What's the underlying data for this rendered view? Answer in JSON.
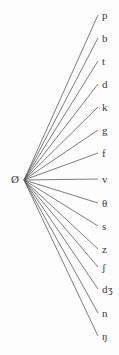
{
  "diagram": {
    "type": "fan-tree",
    "title": "",
    "background_color": "#fdfdfd",
    "edge_color": "#5a5a5a",
    "text_color": "#3a3a3a",
    "root": {
      "label": "Ø",
      "name": "empty-set",
      "x": 15,
      "y": 179
    },
    "edge_start": {
      "x": 24,
      "y": 180
    },
    "edge_end_x": 98,
    "leaf_label_x": 102,
    "leaves": [
      {
        "label": "p",
        "name": "leaf-p",
        "y": 15
      },
      {
        "label": "b",
        "name": "leaf-b",
        "y": 38
      },
      {
        "label": "t",
        "name": "leaf-t",
        "y": 61
      },
      {
        "label": "d",
        "name": "leaf-d",
        "y": 84
      },
      {
        "label": "k",
        "name": "leaf-k",
        "y": 107
      },
      {
        "label": "g",
        "name": "leaf-g",
        "y": 130
      },
      {
        "label": "f",
        "name": "leaf-f",
        "y": 153
      },
      {
        "label": "v",
        "name": "leaf-v",
        "y": 179
      },
      {
        "label": "θ",
        "name": "leaf-theta",
        "y": 203
      },
      {
        "label": "s",
        "name": "leaf-s",
        "y": 226
      },
      {
        "label": "z",
        "name": "leaf-z",
        "y": 249
      },
      {
        "label": "ʃ",
        "name": "leaf-esh",
        "y": 267
      },
      {
        "label": "dʒ",
        "name": "leaf-dezh",
        "y": 289
      },
      {
        "label": "n",
        "name": "leaf-n",
        "y": 313
      },
      {
        "label": "ŋ",
        "name": "leaf-eng",
        "y": 336
      }
    ]
  }
}
